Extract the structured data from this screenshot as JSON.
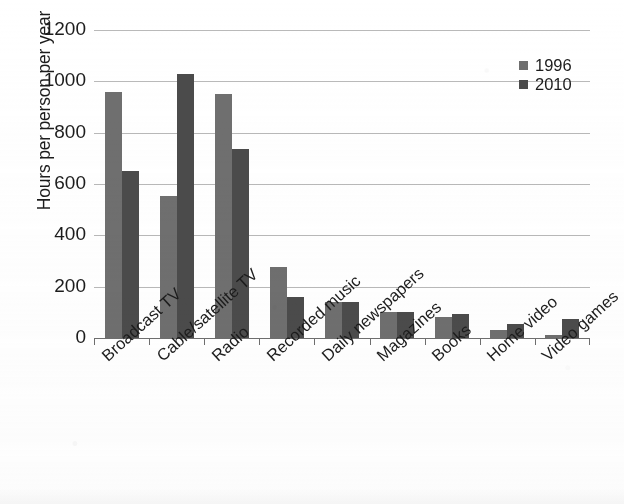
{
  "chart_data": {
    "type": "bar",
    "title": "",
    "subtitle": "",
    "xlabel": "",
    "ylabel": "Hours per person per year",
    "ylim": [
      0,
      1200
    ],
    "yticks": [
      0,
      200,
      400,
      600,
      800,
      1000,
      1200
    ],
    "ytick_labels": [
      "0",
      "200",
      "400",
      "600",
      "800",
      "1000",
      "1200"
    ],
    "grid": true,
    "legend_position": "top-right",
    "categories": [
      "Broadcast TV",
      "Cable/satellite TV",
      "Radio",
      "Recorded music",
      "Daily newspapers",
      "Magazines",
      "Books",
      "Home video",
      "Video games"
    ],
    "series": [
      {
        "name": "1996",
        "color": "#6f6f6f",
        "values": [
          960,
          555,
          950,
          275,
          140,
          100,
          80,
          30,
          10
        ]
      },
      {
        "name": "2010",
        "color": "#4b4b4b",
        "values": [
          650,
          1030,
          735,
          160,
          140,
          100,
          95,
          55,
          75
        ]
      }
    ]
  },
  "legend": {
    "entries": [
      {
        "label": "1996"
      },
      {
        "label": "2010"
      }
    ]
  }
}
